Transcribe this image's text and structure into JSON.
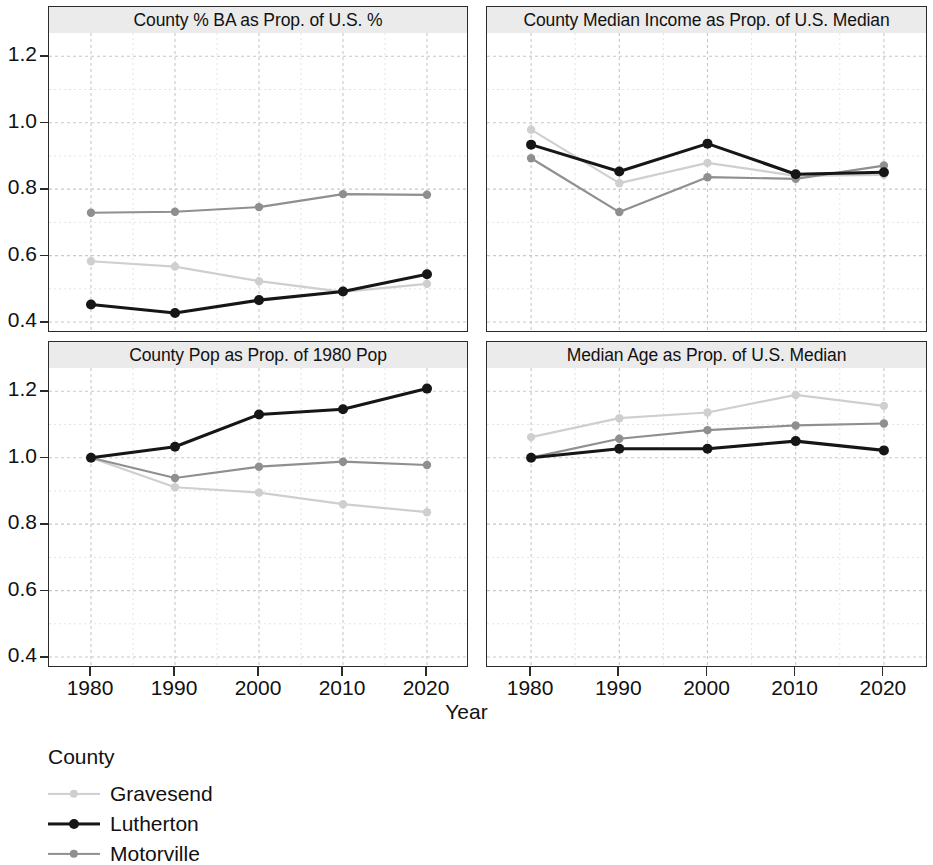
{
  "chart_data": {
    "type": "line",
    "title": "",
    "xlabel": "Year",
    "ylabel": "",
    "x": [
      1980,
      1990,
      2000,
      2010,
      2020
    ],
    "xticklabels": [
      "1980",
      "1990",
      "2000",
      "2010",
      "2020"
    ],
    "yticks": [
      0.4,
      0.6,
      0.8,
      1.0,
      1.2
    ],
    "yticklabels": [
      "0.4",
      "0.6",
      "0.8",
      "1.0",
      "1.2"
    ],
    "ylim": [
      0.37,
      1.27
    ],
    "xlim": [
      1975,
      2025
    ],
    "grid": true,
    "legend": {
      "title": "County",
      "position": "below-left",
      "entries": [
        {
          "name": "Gravesend",
          "color": "#cfcfcf"
        },
        {
          "name": "Lutherton",
          "color": "#161616"
        },
        {
          "name": "Motorville",
          "color": "#8f8f8f"
        }
      ]
    },
    "facets": [
      {
        "title": "County % BA as Prop. of U.S. %",
        "series": [
          {
            "name": "Gravesend",
            "color": "#cfcfcf",
            "values": [
              0.583,
              0.567,
              0.523,
              0.491,
              0.515
            ]
          },
          {
            "name": "Lutherton",
            "color": "#161616",
            "values": [
              0.453,
              0.427,
              0.466,
              0.492,
              0.544
            ]
          },
          {
            "name": "Motorville",
            "color": "#8f8f8f",
            "values": [
              0.729,
              0.732,
              0.746,
              0.785,
              0.783
            ]
          }
        ]
      },
      {
        "title": "County Median Income as Prop. of U.S. Median",
        "series": [
          {
            "name": "Gravesend",
            "color": "#cfcfcf",
            "values": [
              0.979,
              0.818,
              0.879,
              0.84,
              0.843
            ]
          },
          {
            "name": "Lutherton",
            "color": "#161616",
            "values": [
              0.934,
              0.853,
              0.937,
              0.845,
              0.851
            ]
          },
          {
            "name": "Motorville",
            "color": "#8f8f8f",
            "values": [
              0.893,
              0.731,
              0.836,
              0.831,
              0.871
            ]
          }
        ]
      },
      {
        "title": "County Pop as Prop. of 1980 Pop",
        "series": [
          {
            "name": "Gravesend",
            "color": "#cfcfcf",
            "values": [
              1.0,
              0.911,
              0.895,
              0.86,
              0.836
            ]
          },
          {
            "name": "Lutherton",
            "color": "#161616",
            "values": [
              1.0,
              1.033,
              1.13,
              1.146,
              1.208
            ]
          },
          {
            "name": "Motorville",
            "color": "#8f8f8f",
            "values": [
              1.0,
              0.939,
              0.973,
              0.988,
              0.978
            ]
          }
        ]
      },
      {
        "title": "Median Age as Prop. of U.S. Median",
        "series": [
          {
            "name": "Gravesend",
            "color": "#cfcfcf",
            "values": [
              1.062,
              1.119,
              1.136,
              1.189,
              1.156
            ]
          },
          {
            "name": "Lutherton",
            "color": "#161616",
            "values": [
              1.0,
              1.027,
              1.027,
              1.05,
              1.022
            ]
          },
          {
            "name": "Motorville",
            "color": "#8f8f8f",
            "values": [
              1.0,
              1.057,
              1.083,
              1.097,
              1.103
            ]
          }
        ]
      }
    ]
  }
}
